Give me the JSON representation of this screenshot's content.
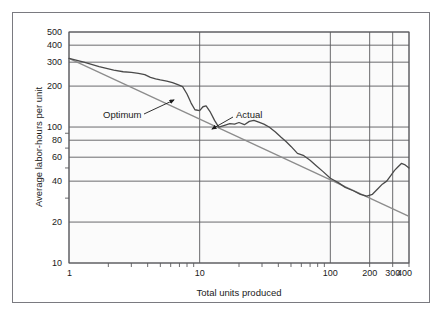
{
  "figure": {
    "background_color": "#ffffff",
    "frame_color": "#7a7a80",
    "plot_background": "#fbfbfb"
  },
  "chart_data": {
    "type": "line",
    "title": "",
    "subtitle": "",
    "xlabel": "Total units produced",
    "ylabel": "Average labor-hours per unit",
    "xscale": "log",
    "yscale": "log",
    "xlim": [
      1,
      400
    ],
    "ylim": [
      10,
      500
    ],
    "grid": true,
    "legend_position": "inline-annotations",
    "x_tick_labels": [
      "1",
      "10",
      "100",
      "200",
      "300",
      "400"
    ],
    "x_tick_values": [
      1,
      10,
      100,
      200,
      300,
      400
    ],
    "y_tick_labels": [
      "500",
      "400",
      "300",
      "200",
      "100",
      "80",
      "60",
      "40",
      "20",
      "10"
    ],
    "y_tick_values": [
      500,
      400,
      300,
      200,
      100,
      80,
      60,
      40,
      20,
      10
    ],
    "y_minor_tick_values": [
      90,
      70,
      50,
      30
    ],
    "series": [
      {
        "name": "Optimum",
        "color": "#8c8c8c",
        "style": "straight-line",
        "x": [
          1,
          400
        ],
        "values": [
          320,
          22
        ]
      },
      {
        "name": "Actual",
        "color": "#4a4a4a",
        "style": "irregular-curve",
        "x": [
          1,
          1.3,
          1.7,
          2.2,
          2.6,
          3.0,
          3.4,
          3.8,
          4.2,
          4.6,
          5.0,
          5.6,
          6.2,
          6.8,
          7.4,
          8.0,
          8.6,
          9.2,
          10.0,
          10.6,
          11.2,
          12.0,
          13.0,
          14.0,
          15.5,
          17.0,
          18.5,
          20.0,
          22.0,
          24.0,
          26.0,
          28.0,
          31.0,
          34.0,
          38.0,
          42.0,
          46.0,
          50.0,
          56.0,
          62.0,
          70.0,
          78.0,
          88.0,
          100.0,
          115.0,
          130.0,
          150.0,
          170.0,
          190.0,
          210.0,
          230.0,
          250.0,
          270.0,
          290.0,
          310.0,
          330.0,
          350.0,
          370.0,
          400.0
        ],
        "values": [
          320,
          300,
          278,
          262,
          255,
          252,
          248,
          243,
          232,
          226,
          222,
          218,
          212,
          205,
          198,
          175,
          150,
          134,
          132,
          141,
          143,
          130,
          112,
          100,
          103,
          106,
          105,
          108,
          104,
          110,
          112,
          109,
          105,
          100,
          92,
          84,
          78,
          72,
          64,
          62,
          57,
          52,
          47,
          42,
          39,
          36,
          34,
          32,
          31,
          32,
          35,
          38,
          40,
          44,
          48,
          51,
          54,
          53,
          50
        ]
      }
    ],
    "annotations": [
      {
        "label": "Optimum",
        "text_position": {
          "x": 90,
          "y": 105
        },
        "arrow_from": {
          "x": 131,
          "y": 101
        },
        "arrow_to": {
          "x": 161,
          "y": 87
        }
      },
      {
        "label": "Actual",
        "text_position": {
          "x": 223,
          "y": 105
        },
        "arrow_from": {
          "x": 220,
          "y": 104
        },
        "arrow_to": {
          "x": 199,
          "y": 116
        }
      }
    ]
  }
}
